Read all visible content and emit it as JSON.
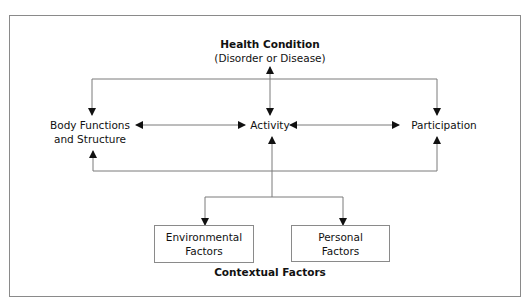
{
  "diagram": {
    "health_condition": {
      "title": "Health Condition",
      "subtitle": "(Disorder or Disease)"
    },
    "components": {
      "body_functions": {
        "line1": "Body Functions",
        "line2": "and Structure"
      },
      "activity": {
        "label": "Activity"
      },
      "participation": {
        "label": "Participation"
      }
    },
    "contextual_factors": {
      "title": "Contextual Factors",
      "environmental": {
        "line1": "Environmental",
        "line2": "Factors"
      },
      "personal": {
        "line1": "Personal",
        "line2": "Factors"
      }
    },
    "colors": {
      "line": "#7a7a7a",
      "arrowhead": "#111111",
      "border": "#8a8a8a",
      "text": "#111111"
    }
  }
}
